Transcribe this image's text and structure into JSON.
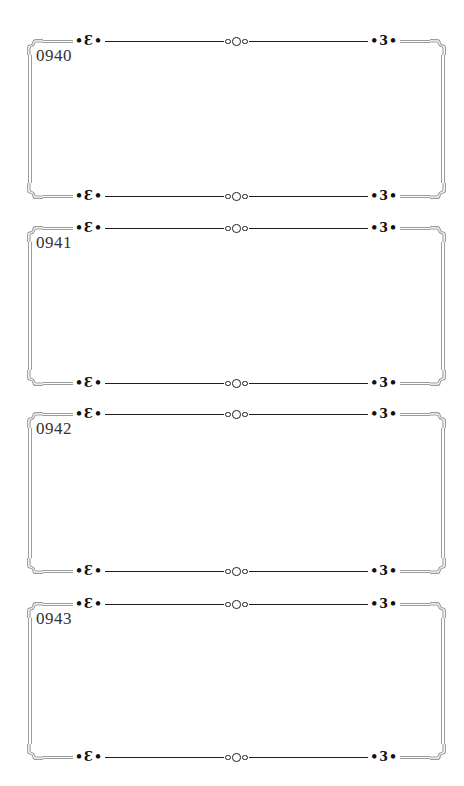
{
  "frames": [
    {
      "number": "0940"
    },
    {
      "number": "0941"
    },
    {
      "number": "0942"
    },
    {
      "number": "0943"
    }
  ],
  "ornaments": {
    "left_scroll": "•Ɛ•",
    "right_scroll": "•3•"
  },
  "colors": {
    "background": "#ffffff",
    "frame_border_gray": "#9c9c9c",
    "rule_line_black": "#1f1f1f",
    "ornament_black": "#111111",
    "number_text": "#333333"
  }
}
